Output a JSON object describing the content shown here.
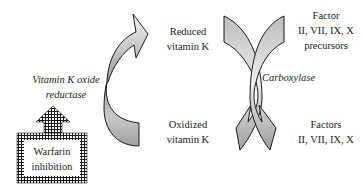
{
  "diagram": {
    "left_cycle": {
      "enzyme_label": "Vitamin K oxide reductase",
      "enzyme_lines": [
        "Vitamin K oxide",
        "reductase"
      ],
      "top_label_lines": [
        "Reduced",
        "vitamin K"
      ],
      "bottom_label_lines": [
        "Oxidized",
        "vitamin K"
      ],
      "inhibitor_box_lines": [
        "Warfarin",
        "inhibition"
      ]
    },
    "right_cycle": {
      "enzyme_label": "Carboxylase",
      "top_label_lines": [
        "Factor",
        "II, VII, IX, X",
        "precursors"
      ],
      "bottom_label_lines": [
        "Factors",
        "II, VII, IX, X"
      ]
    },
    "colors": {
      "arrow_fill_light": "#f2f2f2",
      "arrow_fill_dark": "#a9a9a9",
      "stroke": "#1a1a1a",
      "hatch": "#1a1a1a"
    }
  }
}
